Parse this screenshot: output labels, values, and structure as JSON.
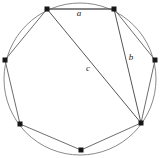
{
  "figure": {
    "background_color": "#ffffff",
    "circle_color": "#8a8a8a",
    "edge_color": "#6e6e6e",
    "chord_color": "#555555",
    "vertex_color": "#161616",
    "label_color": "#1a1a1a",
    "circle": {
      "cx": 80,
      "cy": 79,
      "r": 76
    },
    "vertices": [
      {
        "id": "v1",
        "name": "top-left",
        "x": 47,
        "y": 9
      },
      {
        "id": "v2",
        "name": "top-right",
        "x": 114,
        "y": 9
      },
      {
        "id": "v3",
        "name": "right",
        "x": 155,
        "y": 60
      },
      {
        "id": "v4",
        "name": "lower-right",
        "x": 141,
        "y": 123
      },
      {
        "id": "v5",
        "name": "bottom",
        "x": 81,
        "y": 150
      },
      {
        "id": "v6",
        "name": "lower-left",
        "x": 20,
        "y": 124
      },
      {
        "id": "v7",
        "name": "left",
        "x": 5,
        "y": 60
      }
    ],
    "polygon_path": "M47,9 L114,9 L155,60 L141,123 L81,150 L20,124 L5,60 Z",
    "chords": [
      {
        "id": "chord-a",
        "label": "a",
        "from": "v1",
        "to": "v2",
        "x1": 47,
        "y1": 9,
        "x2": 114,
        "y2": 9,
        "label_x": 79,
        "label_y": 14
      },
      {
        "id": "chord-b",
        "label": "b",
        "from": "v2",
        "to": "v4",
        "x1": 114,
        "y1": 9,
        "x2": 141,
        "y2": 123,
        "label_x": 131,
        "label_y": 58
      },
      {
        "id": "chord-c",
        "label": "c",
        "from": "v1",
        "to": "v4",
        "x1": 47,
        "y1": 9,
        "x2": 141,
        "y2": 123,
        "label_x": 88,
        "label_y": 69
      }
    ]
  }
}
